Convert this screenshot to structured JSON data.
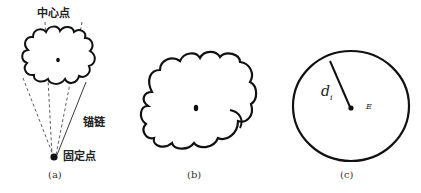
{
  "panels": [
    {
      "id": "a",
      "caption": "(a)",
      "labels": {
        "center_point": "中心点",
        "anchor_chain": "锚链",
        "fixed_point": "固定点"
      }
    },
    {
      "id": "b",
      "caption": "(b)"
    },
    {
      "id": "c",
      "caption": "(c)",
      "labels": {
        "radius": "d",
        "radius_subscript": "i",
        "region": "E"
      }
    }
  ],
  "colors": {
    "stroke": "#111111",
    "background": "#ffffff",
    "text": "#222222"
  }
}
